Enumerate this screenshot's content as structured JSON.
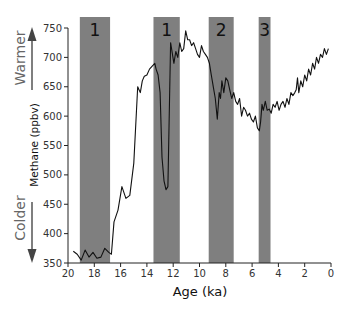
{
  "chart_data": {
    "type": "line",
    "title": "",
    "xlabel": "Age (ka)",
    "ylabel": "Methane (ppbv)",
    "xlim": [
      20,
      0
    ],
    "ylim": [
      350,
      750
    ],
    "x_reversed": true,
    "xticks": [
      20,
      18,
      16,
      14,
      12,
      10,
      8,
      6,
      4,
      2,
      0
    ],
    "yticks": [
      350,
      400,
      450,
      500,
      550,
      600,
      650,
      700,
      750
    ],
    "grid": false,
    "legend": null,
    "annotations": [
      {
        "text": "Warmer",
        "direction": "up",
        "position": "upper-left"
      },
      {
        "text": "Colder",
        "direction": "down",
        "position": "lower-left"
      }
    ],
    "shaded_bands": [
      {
        "label": "1",
        "x_start": 19.1,
        "x_end": 16.8
      },
      {
        "label": "1",
        "x_start": 13.5,
        "x_end": 11.5
      },
      {
        "label": "2",
        "x_start": 9.3,
        "x_end": 7.4
      },
      {
        "label": "3",
        "x_start": 5.5,
        "x_end": 4.6
      }
    ],
    "band_color": "#7f7f7f",
    "series": [
      {
        "name": "Methane",
        "color": "#111111",
        "x": [
          19.6,
          19.3,
          19.0,
          18.7,
          18.4,
          18.1,
          17.8,
          17.5,
          17.2,
          16.9,
          16.7,
          16.5,
          16.2,
          15.9,
          15.6,
          15.3,
          15.0,
          14.7,
          14.5,
          14.35,
          14.2,
          14.0,
          13.8,
          13.6,
          13.4,
          13.3,
          13.15,
          13.0,
          12.85,
          12.7,
          12.55,
          12.4,
          12.2,
          11.95,
          11.8,
          11.65,
          11.5,
          11.35,
          11.2,
          11.05,
          10.9,
          10.75,
          10.6,
          10.45,
          10.3,
          10.15,
          10.0,
          9.85,
          9.7,
          9.55,
          9.4,
          9.25,
          9.1,
          8.95,
          8.8,
          8.65,
          8.5,
          8.4,
          8.3,
          8.15,
          8.0,
          7.85,
          7.7,
          7.55,
          7.4,
          7.25,
          7.1,
          6.95,
          6.8,
          6.65,
          6.5,
          6.35,
          6.2,
          6.05,
          5.9,
          5.75,
          5.6,
          5.45,
          5.35,
          5.25,
          5.15,
          5.0,
          4.85,
          4.7,
          4.55,
          4.4,
          4.25,
          4.1,
          3.95,
          3.8,
          3.65,
          3.5,
          3.35,
          3.2,
          3.05,
          2.9,
          2.75,
          2.65,
          2.55,
          2.45,
          2.3,
          2.15,
          2.0,
          1.85,
          1.7,
          1.55,
          1.4,
          1.25,
          1.1,
          0.95,
          0.8,
          0.65,
          0.5,
          0.35,
          0.2
        ],
        "y": [
          370,
          365,
          355,
          372,
          360,
          368,
          358,
          360,
          375,
          368,
          365,
          420,
          440,
          480,
          460,
          465,
          520,
          650,
          640,
          660,
          668,
          670,
          680,
          685,
          690,
          680,
          670,
          640,
          530,
          490,
          475,
          480,
          725,
          690,
          710,
          700,
          725,
          710,
          715,
          745,
          730,
          730,
          720,
          725,
          715,
          705,
          700,
          720,
          710,
          705,
          700,
          690,
          670,
          650,
          630,
          595,
          640,
          630,
          660,
          640,
          665,
          660,
          645,
          630,
          640,
          625,
          620,
          630,
          600,
          615,
          610,
          600,
          605,
          595,
          590,
          600,
          580,
          575,
          590,
          620,
          610,
          625,
          610,
          612,
          605,
          620,
          615,
          625,
          610,
          620,
          625,
          615,
          630,
          620,
          640,
          635,
          640,
          645,
          665,
          640,
          660,
          650,
          670,
          660,
          680,
          670,
          690,
          680,
          700,
          690,
          705,
          700,
          715,
          705,
          715
        ]
      }
    ]
  },
  "labels": {
    "warmer": "Warmer",
    "colder": "Colder",
    "ylabel": "Methane (ppbv)",
    "xlabel": "Age (ka)"
  }
}
